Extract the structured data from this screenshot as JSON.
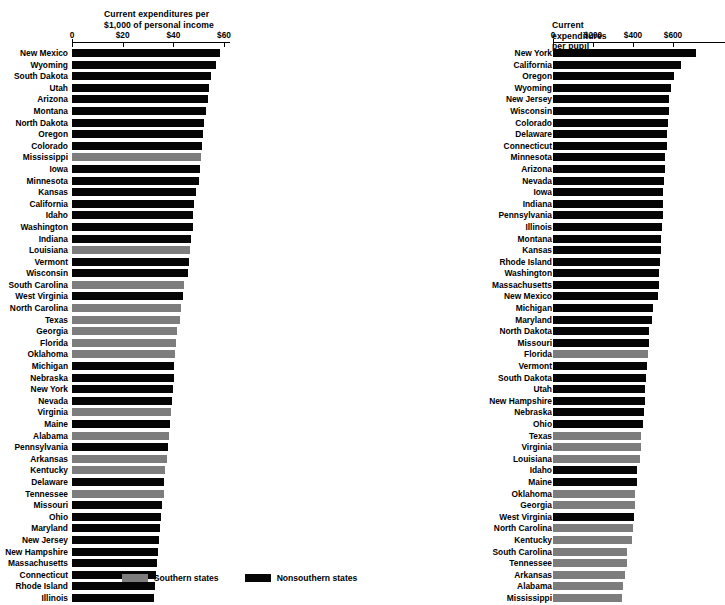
{
  "legend": {
    "south_label": "Southern states",
    "nonsouth_label": "Nonsouthern states",
    "south_color": "#7d7d7d",
    "nonsouth_color": "#050505"
  },
  "chart_data": [
    {
      "id": "left",
      "type": "bar",
      "orientation": "horizontal",
      "title": "Current expenditures per\n$1,000 of personal income",
      "xlabel": "",
      "ylabel": "",
      "xlim": [
        0,
        60
      ],
      "ticks": [
        0,
        20,
        40,
        60
      ],
      "tick_labels": [
        "0",
        "$20",
        "$40",
        "$60"
      ],
      "grid": false,
      "legend_position": "bottom-center",
      "series": [
        {
          "name": "Southern states",
          "color": "#7d7d7d"
        },
        {
          "name": "Nonsouthern states",
          "color": "#050505"
        }
      ],
      "categories": [
        "New Mexico",
        "Wyoming",
        "South Dakota",
        "Utah",
        "Arizona",
        "Montana",
        "North Dakota",
        "Oregon",
        "Colorado",
        "Mississippi",
        "Iowa",
        "Minnesota",
        "Kansas",
        "California",
        "Idaho",
        "Washington",
        "Indiana",
        "Louisiana",
        "Vermont",
        "Wisconsin",
        "South Carolina",
        "West Virginia",
        "North Carolina",
        "Texas",
        "Georgia",
        "Florida",
        "Oklahoma",
        "Michigan",
        "Nebraska",
        "New York",
        "Nevada",
        "Virginia",
        "Maine",
        "Alabama",
        "Pennsylvania",
        "Arkansas",
        "Kentucky",
        "Delaware",
        "Tennessee",
        "Missouri",
        "Ohio",
        "Maryland",
        "New Jersey",
        "New Hampshire",
        "Massachusetts",
        "Connecticut",
        "Rhode Island",
        "Illinois"
      ],
      "values": [
        58.5,
        56.8,
        54.8,
        54.2,
        53.8,
        52.8,
        52.3,
        51.6,
        51.2,
        50.8,
        50.4,
        50.2,
        48.8,
        48.2,
        47.8,
        47.6,
        46.8,
        46.4,
        46.0,
        45.6,
        44.4,
        44.0,
        43.2,
        42.6,
        41.6,
        41.2,
        40.8,
        40.4,
        40.2,
        40.0,
        39.6,
        39.0,
        38.8,
        38.4,
        38.0,
        37.4,
        36.8,
        36.4,
        36.2,
        35.4,
        35.2,
        34.8,
        34.4,
        34.0,
        33.6,
        33.2,
        32.8,
        32.2
      ],
      "groups": [
        "nonsouth",
        "nonsouth",
        "nonsouth",
        "nonsouth",
        "nonsouth",
        "nonsouth",
        "nonsouth",
        "nonsouth",
        "nonsouth",
        "south",
        "nonsouth",
        "nonsouth",
        "nonsouth",
        "nonsouth",
        "nonsouth",
        "nonsouth",
        "nonsouth",
        "south",
        "nonsouth",
        "nonsouth",
        "south",
        "nonsouth",
        "south",
        "south",
        "south",
        "south",
        "south",
        "nonsouth",
        "nonsouth",
        "nonsouth",
        "nonsouth",
        "south",
        "nonsouth",
        "south",
        "nonsouth",
        "south",
        "south",
        "nonsouth",
        "south",
        "nonsouth",
        "nonsouth",
        "nonsouth",
        "nonsouth",
        "nonsouth",
        "nonsouth",
        "nonsouth",
        "nonsouth",
        "nonsouth"
      ]
    },
    {
      "id": "right",
      "type": "bar",
      "orientation": "horizontal",
      "title": "Current expenditures per pupil",
      "xlabel": "",
      "ylabel": "",
      "xlim": [
        0,
        800
      ],
      "ticks": [
        0,
        200,
        400,
        600
      ],
      "tick_labels": [
        "0",
        "$200",
        "$400",
        "$600"
      ],
      "grid": false,
      "legend_position": "bottom-center",
      "series": [
        {
          "name": "Southern states",
          "color": "#7d7d7d"
        },
        {
          "name": "Nonsouthern states",
          "color": "#050505"
        }
      ],
      "categories": [
        "New York",
        "California",
        "Oregon",
        "Wyoming",
        "New Jersey",
        "Wisconsin",
        "Colorado",
        "Delaware",
        "Connecticut",
        "Minnesota",
        "Arizona",
        "Nevada",
        "Iowa",
        "Indiana",
        "Pennsylvania",
        "Illinois",
        "Montana",
        "Kansas",
        "Rhode Island",
        "Washington",
        "Massachusetts",
        "New Mexico",
        "Michigan",
        "Maryland",
        "North Dakota",
        "Missouri",
        "Florida",
        "Vermont",
        "South Dakota",
        "Utah",
        "New Hampshire",
        "Nebraska",
        "Ohio",
        "Texas",
        "Virginia",
        "Louisiana",
        "Idaho",
        "Maine",
        "Oklahoma",
        "Georgia",
        "West Virginia",
        "North Carolina",
        "Kentucky",
        "South Carolina",
        "Tennessee",
        "Arkansas",
        "Alabama",
        "Mississippi"
      ],
      "values": [
        715,
        640,
        605,
        590,
        580,
        578,
        575,
        572,
        568,
        560,
        558,
        556,
        552,
        550,
        548,
        546,
        540,
        538,
        536,
        532,
        528,
        524,
        500,
        496,
        480,
        478,
        474,
        470,
        466,
        462,
        458,
        454,
        450,
        440,
        438,
        434,
        420,
        418,
        412,
        408,
        404,
        400,
        396,
        372,
        368,
        362,
        350,
        344
      ],
      "groups": [
        "nonsouth",
        "nonsouth",
        "nonsouth",
        "nonsouth",
        "nonsouth",
        "nonsouth",
        "nonsouth",
        "nonsouth",
        "nonsouth",
        "nonsouth",
        "nonsouth",
        "nonsouth",
        "nonsouth",
        "nonsouth",
        "nonsouth",
        "nonsouth",
        "nonsouth",
        "nonsouth",
        "nonsouth",
        "nonsouth",
        "nonsouth",
        "nonsouth",
        "nonsouth",
        "nonsouth",
        "nonsouth",
        "nonsouth",
        "south",
        "nonsouth",
        "nonsouth",
        "nonsouth",
        "nonsouth",
        "nonsouth",
        "nonsouth",
        "south",
        "south",
        "south",
        "nonsouth",
        "nonsouth",
        "south",
        "south",
        "nonsouth",
        "south",
        "south",
        "south",
        "south",
        "south",
        "south",
        "south"
      ]
    }
  ]
}
